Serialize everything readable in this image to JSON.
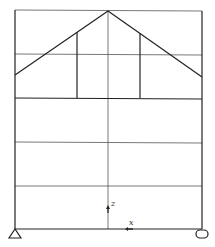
{
  "diagram": {
    "type": "structural-frame",
    "colors": {
      "line": "#222222",
      "grid": "#444444",
      "background": "#ffffff"
    },
    "frame": {
      "left_x": 15,
      "right_x": 202,
      "top_y": 10,
      "bottom_y": 229
    },
    "grid_horizontal_y": [
      10,
      54,
      98,
      142,
      186
    ],
    "center_x": 108,
    "roof": {
      "apex": [
        108,
        11
      ],
      "left_eave": [
        15,
        75
      ],
      "right_eave": [
        202,
        77
      ]
    },
    "posts": [
      {
        "x": 77,
        "top_y": 32,
        "bottom_y": 98
      },
      {
        "x": 140,
        "top_y": 32,
        "bottom_y": 98
      }
    ],
    "supports": [
      {
        "type": "pin",
        "label": "pin-support",
        "x": 15,
        "y": 229
      },
      {
        "type": "roller",
        "label": "roller-support",
        "x": 202,
        "y": 229
      }
    ],
    "axes": {
      "z_label": "z",
      "x_label": "x",
      "origin": [
        108,
        229
      ]
    }
  }
}
